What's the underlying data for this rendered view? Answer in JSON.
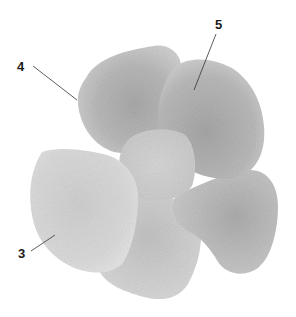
{
  "figure": {
    "type": "botanical illustration",
    "colors": {
      "background": "#ffffff",
      "petal_dark": "#a8a8a8",
      "petal_mid": "#c4c4c4",
      "petal_light": "#dedede",
      "leader_line": "#333333",
      "label_text": "#1a1a1a"
    },
    "labels": [
      {
        "id": "4",
        "text": "4",
        "x": 21,
        "y": 70,
        "line": [
          33,
          66,
          77,
          100
        ]
      },
      {
        "id": "5",
        "text": "5",
        "x": 219,
        "y": 28,
        "line": [
          216,
          34,
          194,
          90
        ]
      },
      {
        "id": "3",
        "text": "3",
        "x": 22,
        "y": 257,
        "line": [
          31,
          251,
          55,
          235
        ]
      }
    ]
  }
}
